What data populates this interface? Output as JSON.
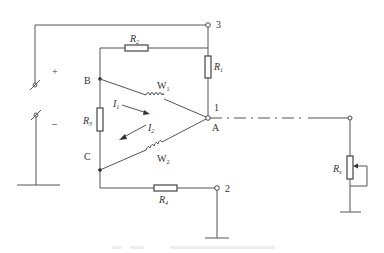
{
  "diagram": {
    "type": "circuit-schematic",
    "terminals": [
      {
        "id": "terminal-3",
        "label": "3"
      },
      {
        "id": "terminal-1",
        "label": "1"
      },
      {
        "id": "terminal-2",
        "label": "2"
      }
    ],
    "nodes": {
      "A": "A",
      "B": "B",
      "C": "C"
    },
    "resistors": {
      "R1": {
        "main": "R",
        "sub": "1"
      },
      "R2": {
        "main": "R",
        "sub": "2"
      },
      "R3": {
        "main": "R",
        "sub": "3"
      },
      "R4": {
        "main": "R",
        "sub": "4"
      },
      "Rx": {
        "main": "R",
        "sub": "x"
      }
    },
    "windings": {
      "W1": {
        "main": "W",
        "sub": "1"
      },
      "W2": {
        "main": "W",
        "sub": "2"
      }
    },
    "currents": {
      "I1": {
        "main": "I",
        "sub": "1"
      },
      "I2": {
        "main": "I",
        "sub": "2"
      }
    },
    "source": {
      "plus": "+",
      "minus": "–"
    },
    "caption": ""
  }
}
